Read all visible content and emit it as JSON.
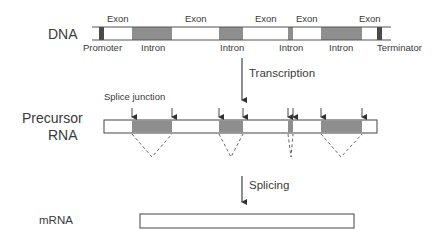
{
  "diagram": {
    "rows": {
      "dna": {
        "label": "DNA"
      },
      "precursor": {
        "label_line1": "Precursor",
        "label_line2": "RNA"
      },
      "mrna": {
        "label": "mRNA"
      }
    },
    "dna_segments": {
      "exon_labels": [
        "Exon",
        "Exon",
        "Exon",
        "Exon",
        "Exon"
      ],
      "intron_labels": [
        "Intron",
        "Intron",
        "Intron",
        "Intron"
      ],
      "promoter_label": "Promoter",
      "terminator_label": "Terminator"
    },
    "steps": {
      "transcription": "Transcription",
      "splicing": "Splicing"
    },
    "annotations": {
      "splice_junction": "Splice junction"
    },
    "colors": {
      "intron_fill": "#8e8e8e",
      "regulatory_fill": "#4a4a4a",
      "line": "#555555",
      "exon_fill": "#ffffff"
    }
  }
}
